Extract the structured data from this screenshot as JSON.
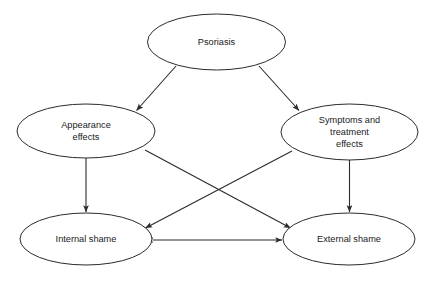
{
  "diagram": {
    "background_color": "#ffffff",
    "stroke_color": "#2b2b2b",
    "text_color": "#1a1a1a",
    "nodes": [
      {
        "id": "psoriasis",
        "label": "Psoriasis",
        "lines": [
          "Psoriasis"
        ],
        "cx": 216.5,
        "cy": 42,
        "rx": 69,
        "ry": 28
      },
      {
        "id": "appearance-effects",
        "label": "Appearance effects",
        "lines": [
          "Appearance",
          "effects"
        ],
        "cx": 86,
        "cy": 131,
        "rx": 69,
        "ry": 27
      },
      {
        "id": "symptoms-and-treatment-effects",
        "label": "Symptoms and treatment effects",
        "lines": [
          "Symptoms and",
          "treatment",
          "effects"
        ],
        "cx": 349.5,
        "cy": 132,
        "rx": 68.5,
        "ry": 28
      },
      {
        "id": "internal-shame",
        "label": "Internal shame",
        "lines": [
          "Internal shame"
        ],
        "cx": 86,
        "cy": 239,
        "rx": 66,
        "ry": 26
      },
      {
        "id": "external-shame",
        "label": "External shame",
        "lines": [
          "External shame"
        ],
        "cx": 349,
        "cy": 239,
        "rx": 66,
        "ry": 26
      }
    ],
    "edges": [
      {
        "id": "psoriasis-to-appearance-effects",
        "from": "Psoriasis",
        "to": "Appearance effects",
        "direction": "one-way"
      },
      {
        "id": "psoriasis-to-symptoms-and-treatment-effects",
        "from": "Psoriasis",
        "to": "Symptoms and treatment effects",
        "direction": "one-way"
      },
      {
        "id": "appearance-effects-to-internal-shame",
        "from": "Appearance effects",
        "to": "Internal shame",
        "direction": "one-way"
      },
      {
        "id": "appearance-effects-to-external-shame",
        "from": "Appearance effects",
        "to": "External shame",
        "direction": "one-way"
      },
      {
        "id": "symptoms-and-treatment-effects-to-internal-shame",
        "from": "Symptoms and treatment effects",
        "to": "Internal shame",
        "direction": "one-way"
      },
      {
        "id": "symptoms-and-treatment-effects-to-external-shame",
        "from": "Symptoms and treatment effects",
        "to": "External shame",
        "direction": "one-way"
      },
      {
        "id": "internal-shame-external-shame",
        "from": "Internal shame",
        "to": "External shame",
        "direction": "two-way"
      }
    ]
  }
}
